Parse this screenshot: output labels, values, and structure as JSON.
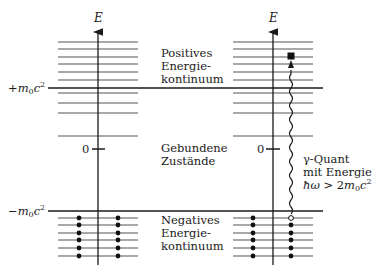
{
  "axis_label": "E",
  "left_labels": {
    "plus_m0c2": "+m0c2",
    "zero": "0",
    "minus_m0c2": "−m0c2"
  },
  "right_labels": {
    "zero": "0"
  },
  "regions": {
    "positive": [
      "Positives",
      "Energie-",
      "kontinuum"
    ],
    "bound": [
      "Gebundene",
      "Zustände"
    ],
    "negative": [
      "Negatives",
      "Energie-",
      "kontinuum"
    ]
  },
  "photon": {
    "line1": "γ-Quant",
    "line2": "mit Energie",
    "line3": "ħω > 2m0c2"
  },
  "colors": {
    "line": "#1a1a1a",
    "level": "#555555"
  }
}
